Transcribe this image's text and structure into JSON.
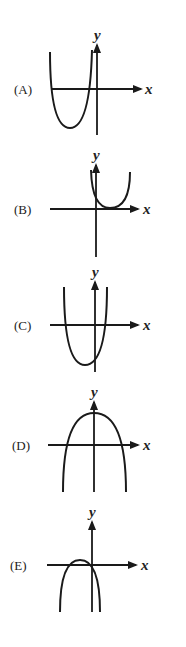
{
  "options": [
    {
      "label": "(A)",
      "x_axis_label": "x",
      "y_axis_label": "y",
      "description": "Upward-opening parabola, vertex below x-axis, both roots left of y-axis",
      "geometry": {
        "origin": [
          97,
          89
        ],
        "x_axis": [
          52,
          143
        ],
        "y_axis": [
          43,
          135
        ],
        "curve": [
          [
            50,
            52
          ],
          [
            70,
            128
          ],
          [
            92,
            50
          ]
        ],
        "label_pos": [
          14,
          94
        ]
      }
    },
    {
      "label": "(B)",
      "x_axis_label": "x",
      "y_axis_label": "y",
      "description": "Upward-opening parabola, vertex on positive x-axis (tangent), one repeated root right of y-axis",
      "geometry": {
        "origin": [
          96,
          209
        ],
        "x_axis": [
          50,
          140
        ],
        "y_axis": [
          163,
          257
        ],
        "curve": [
          [
            91,
            170
          ],
          [
            110,
            208
          ],
          [
            130,
            172
          ]
        ],
        "label_pos": [
          14,
          214
        ]
      }
    },
    {
      "label": "(C)",
      "x_axis_label": "x",
      "y_axis_label": "y",
      "description": "Upward-opening parabola, vertex below x-axis slightly left of y-axis, roots on both sides of origin",
      "geometry": {
        "origin": [
          95,
          325
        ],
        "x_axis": [
          50,
          140
        ],
        "y_axis": [
          280,
          372
        ],
        "curve": [
          [
            64,
            287
          ],
          [
            85,
            365
          ],
          [
            107,
            287
          ]
        ],
        "label_pos": [
          14,
          330
        ]
      }
    },
    {
      "label": "(D)",
      "x_axis_label": "x",
      "y_axis_label": "y",
      "description": "Downward-opening parabola, vertex on positive y-axis, symmetric roots",
      "geometry": {
        "origin": [
          94,
          445
        ],
        "x_axis": [
          48,
          140
        ],
        "y_axis": [
          400,
          492
        ],
        "curve": [
          [
            63,
            492
          ],
          [
            94,
            413
          ],
          [
            126,
            492
          ]
        ],
        "label_pos": [
          12,
          450
        ]
      }
    },
    {
      "label": "(E)",
      "x_axis_label": "x",
      "y_axis_label": "y",
      "description": "Downward-opening parabola, vertex slightly above x-axis left of y-axis, small positive maximum",
      "geometry": {
        "origin": [
          92,
          565
        ],
        "x_axis": [
          47,
          138
        ],
        "y_axis": [
          520,
          612
        ],
        "curve": [
          [
            60,
            612
          ],
          [
            80,
            560
          ],
          [
            100,
            612
          ]
        ],
        "label_pos": [
          10,
          570
        ]
      }
    }
  ]
}
